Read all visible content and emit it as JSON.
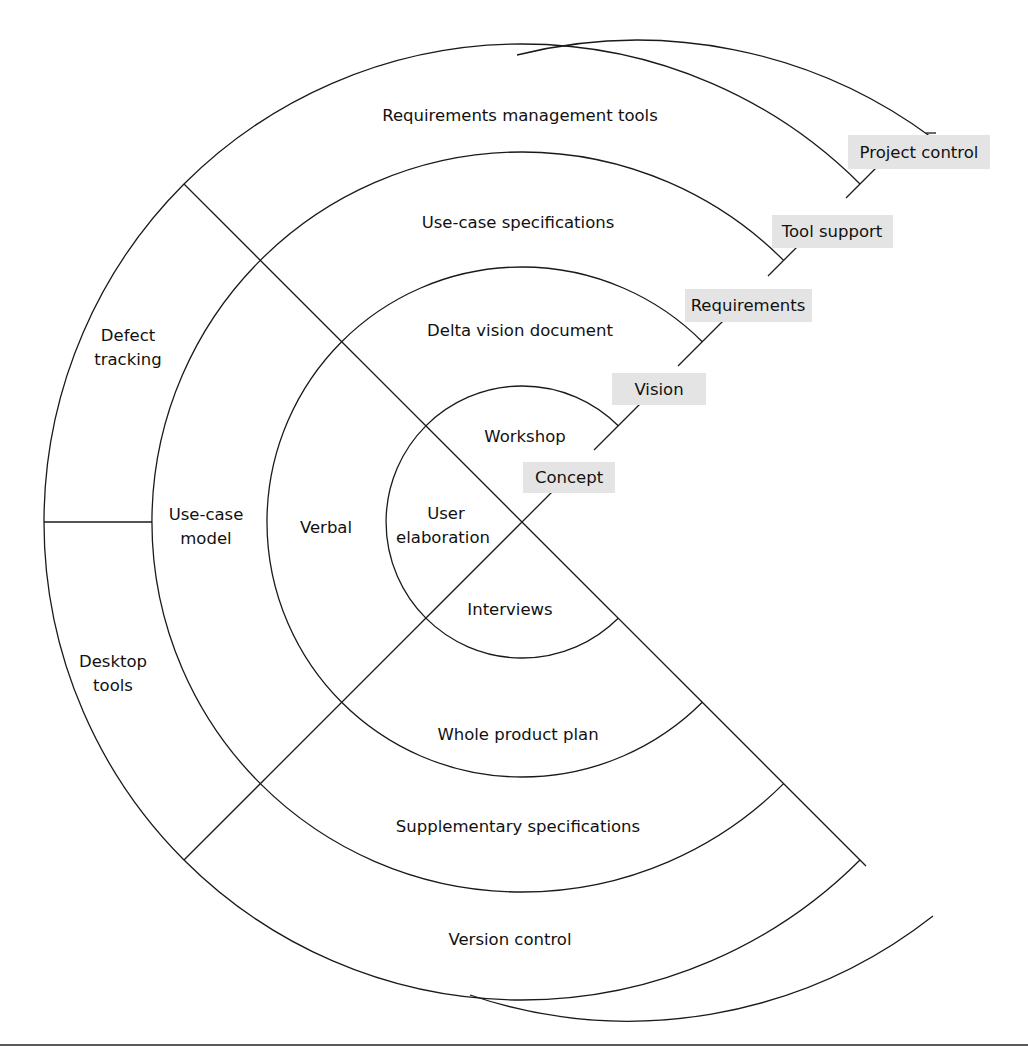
{
  "diagram": {
    "type": "concentric-ring-diagram",
    "rings": [
      {
        "phase": "Concept",
        "segments": {
          "top": "Workshop",
          "left_line1": "User",
          "left_line2": "elaboration",
          "bottom": "Interviews"
        }
      },
      {
        "phase": "Vision",
        "segments": {
          "top": "Delta vision document",
          "left": "Verbal",
          "bottom": "Whole product plan"
        }
      },
      {
        "phase": "Requirements",
        "segments": {
          "top": "Use-case specifications",
          "left_line1": "Use-case",
          "left_line2": "model",
          "bottom": "Supplementary specifications"
        }
      },
      {
        "phase": "Tool support",
        "segments": {
          "top": "Requirements management tools",
          "upper_left_line1": "Defect",
          "upper_left_line2": "tracking",
          "lower_left_line1": "Desktop",
          "lower_left_line2": "tools",
          "bottom": "Version control"
        }
      },
      {
        "phase": "Project control",
        "segments": {}
      }
    ],
    "phase_tags": [
      "Concept",
      "Vision",
      "Requirements",
      "Tool support",
      "Project control"
    ],
    "colors": {
      "line": "#1a1a1a",
      "tag_background": "#e4e4e4",
      "text": "#111111",
      "background": "#ffffff"
    }
  }
}
